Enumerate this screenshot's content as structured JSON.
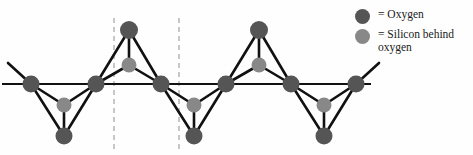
{
  "figure": {
    "width": 473,
    "height": 155,
    "background": "#fefefe"
  },
  "colors": {
    "oxygen": "#555555",
    "silicon": "#888888",
    "bond": "#111111",
    "chain_line": "#111111",
    "unit_cell_dash": "#9a9a9a",
    "text": "#1a1a1a"
  },
  "legend": {
    "rows": [
      {
        "swatch": "oxygen-swatch",
        "color": "#555555",
        "label": "= Oxygen"
      },
      {
        "swatch": "silicon-swatch",
        "color": "#888888",
        "label": "= Silicon behind\n   oxygen"
      }
    ]
  },
  "diagram": {
    "chain_line": {
      "x1": 2,
      "y1": 84,
      "x2": 371,
      "y2": 84,
      "width": 2.2
    },
    "unit_cell_lines": [
      {
        "x": 114,
        "y1": 18,
        "y2": 150
      },
      {
        "x": 179,
        "y1": 18,
        "y2": 150
      }
    ],
    "chain_oxygens": [
      {
        "cx": 31,
        "cy": 84,
        "r": 8.5
      },
      {
        "cx": 96,
        "cy": 84,
        "r": 8.5
      },
      {
        "cx": 161,
        "cy": 84,
        "r": 8.5
      },
      {
        "cx": 226,
        "cy": 84,
        "r": 8.5
      },
      {
        "cx": 291,
        "cy": 84,
        "r": 8.5
      },
      {
        "cx": 356,
        "cy": 84,
        "r": 8.5
      }
    ],
    "apex_oxygens": [
      {
        "cx": 64,
        "cy": 136,
        "r": 8.5,
        "direction": "down"
      },
      {
        "cx": 129,
        "cy": 30,
        "r": 9.0,
        "direction": "up"
      },
      {
        "cx": 194,
        "cy": 136,
        "r": 8.5,
        "direction": "down"
      },
      {
        "cx": 259,
        "cy": 30,
        "r": 9.0,
        "direction": "up"
      },
      {
        "cx": 324,
        "cy": 136,
        "r": 8.5,
        "direction": "down"
      }
    ],
    "silicons": [
      {
        "cx": 64,
        "cy": 105,
        "r": 7.5,
        "direction": "down"
      },
      {
        "cx": 129,
        "cy": 65,
        "r": 7.5,
        "direction": "up"
      },
      {
        "cx": 194,
        "cy": 105,
        "r": 7.5,
        "direction": "down"
      },
      {
        "cx": 259,
        "cy": 65,
        "r": 7.5,
        "direction": "up"
      },
      {
        "cx": 324,
        "cy": 105,
        "r": 7.5,
        "direction": "down"
      }
    ],
    "bonds": [
      {
        "x1": 31,
        "y1": 84,
        "x2": 64,
        "y2": 136
      },
      {
        "x1": 96,
        "y1": 84,
        "x2": 64,
        "y2": 136
      },
      {
        "x1": 31,
        "y1": 84,
        "x2": 64,
        "y2": 105
      },
      {
        "x1": 96,
        "y1": 84,
        "x2": 64,
        "y2": 105
      },
      {
        "x1": 64,
        "y1": 105,
        "x2": 64,
        "y2": 136
      },
      {
        "x1": 96,
        "y1": 84,
        "x2": 129,
        "y2": 30
      },
      {
        "x1": 161,
        "y1": 84,
        "x2": 129,
        "y2": 30
      },
      {
        "x1": 96,
        "y1": 84,
        "x2": 129,
        "y2": 65
      },
      {
        "x1": 161,
        "y1": 84,
        "x2": 129,
        "y2": 65
      },
      {
        "x1": 129,
        "y1": 65,
        "x2": 129,
        "y2": 30
      },
      {
        "x1": 161,
        "y1": 84,
        "x2": 194,
        "y2": 136
      },
      {
        "x1": 226,
        "y1": 84,
        "x2": 194,
        "y2": 136
      },
      {
        "x1": 161,
        "y1": 84,
        "x2": 194,
        "y2": 105
      },
      {
        "x1": 226,
        "y1": 84,
        "x2": 194,
        "y2": 105
      },
      {
        "x1": 194,
        "y1": 105,
        "x2": 194,
        "y2": 136
      },
      {
        "x1": 226,
        "y1": 84,
        "x2": 259,
        "y2": 30
      },
      {
        "x1": 291,
        "y1": 84,
        "x2": 259,
        "y2": 30
      },
      {
        "x1": 226,
        "y1": 84,
        "x2": 259,
        "y2": 65
      },
      {
        "x1": 291,
        "y1": 84,
        "x2": 259,
        "y2": 65
      },
      {
        "x1": 259,
        "y1": 65,
        "x2": 259,
        "y2": 30
      },
      {
        "x1": 291,
        "y1": 84,
        "x2": 324,
        "y2": 136
      },
      {
        "x1": 356,
        "y1": 84,
        "x2": 324,
        "y2": 136
      },
      {
        "x1": 291,
        "y1": 84,
        "x2": 324,
        "y2": 105
      },
      {
        "x1": 356,
        "y1": 84,
        "x2": 324,
        "y2": 105
      },
      {
        "x1": 324,
        "y1": 105,
        "x2": 324,
        "y2": 136
      }
    ],
    "edge_bonds": [
      {
        "x1": 31,
        "y1": 84,
        "x2": 8,
        "y2": 63
      },
      {
        "x1": 356,
        "y1": 84,
        "x2": 379,
        "y2": 63
      }
    ]
  }
}
